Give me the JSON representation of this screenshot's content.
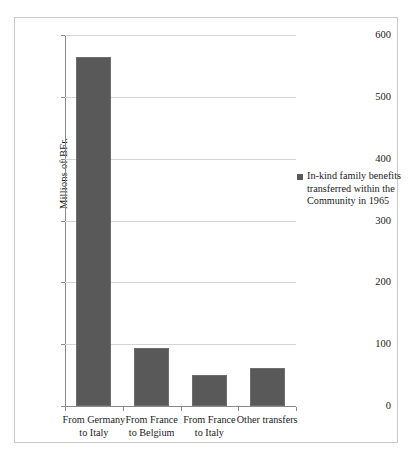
{
  "chart_data": {
    "type": "bar",
    "title": "",
    "subtitle": "",
    "xlabel": "",
    "ylabel": "Millions of BFr.",
    "ylim": [
      0,
      600
    ],
    "ytick_interval": 100,
    "yticks": [
      "0",
      "100",
      "200",
      "300",
      "400",
      "500",
      "600"
    ],
    "grid": true,
    "grid_axis": "y",
    "legend_position": "right",
    "categories": [
      "From Germany to Italy",
      "From France to Belgium",
      "From France to Italy",
      "Other transfers"
    ],
    "category_lines": [
      [
        "From Germany",
        "to Italy"
      ],
      [
        "From France",
        "to Belgium"
      ],
      [
        "From France",
        "to Italy"
      ],
      [
        "Other transfers"
      ]
    ],
    "values": [
      564,
      93,
      50,
      62
    ],
    "series": [
      {
        "name": "In-kind family benefits transferred within the Community in 1965",
        "values": [
          564,
          93,
          50,
          62
        ],
        "color": "#595959"
      }
    ],
    "legend": [
      {
        "label": "In-kind family benefits transferred within the Community in 1965",
        "color": "#595959"
      }
    ]
  },
  "colors": {
    "bar_fill": "#595959",
    "bar_stroke": "#6e6e6e",
    "gridline": "#d5d5d5",
    "axis_line": "#8a8a8a",
    "frame_border": "#c9c9c9",
    "background": "#ffffff",
    "text": "#1a1a1a"
  }
}
